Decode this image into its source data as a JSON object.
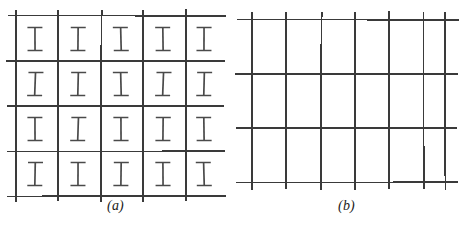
{
  "figure": {
    "width": 462,
    "height": 227,
    "background_color": "#ffffff",
    "line_color": "#3a3a3a",
    "glyph_color": "#4a4a4a",
    "caption_color": "#1a1a1a"
  },
  "panels": [
    {
      "id": "a",
      "caption": "(a)",
      "glyph": "I",
      "glyph_name": "serif-capital-i",
      "rows": 4,
      "columns": 5,
      "vertical_line_count": 5,
      "horizontal_line_count": 5,
      "bounds": {
        "x0": 13,
        "x1": 219,
        "y0": 16,
        "y1": 196
      },
      "vertical_lines_x": [
        16,
        58,
        101,
        143,
        186
      ],
      "horizontal_lines_y": [
        16,
        61,
        106,
        151,
        196
      ],
      "glyph_columns_x": [
        35,
        78,
        121,
        163,
        204
      ],
      "glyph_rows_y": [
        39,
        84,
        129,
        174
      ],
      "line_overhang": 6
    },
    {
      "id": "b",
      "caption": "(b)",
      "glyph": "",
      "glyph_name": "none",
      "rows": 3,
      "columns": 6,
      "vertical_line_count": 7,
      "horizontal_line_count": 4,
      "bounds": {
        "x0": 13,
        "x1": 219,
        "y0": 16,
        "y1": 196
      },
      "vertical_lines_x": [
        21,
        55,
        90,
        124,
        158,
        192,
        214
      ],
      "horizontal_lines_y": [
        20,
        74,
        128,
        182
      ],
      "line_overhang": 8
    }
  ]
}
